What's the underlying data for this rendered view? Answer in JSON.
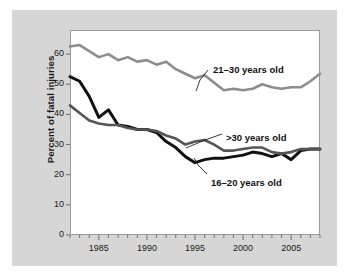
{
  "figure": {
    "background_color": "#d6d6d6",
    "plot_background_color": "#ffffff",
    "frame_color": "#9a9a9a"
  },
  "chart_data": {
    "type": "line",
    "title": "",
    "xlabel": "",
    "ylabel": "Percent of fatal injuries",
    "xlim": [
      1982,
      2008
    ],
    "ylim": [
      0,
      68
    ],
    "ytick_labels": [
      "0",
      "10",
      "20",
      "30",
      "40",
      "50",
      "60"
    ],
    "yticks": [
      0,
      10,
      20,
      30,
      40,
      50,
      60
    ],
    "xtick_labels": [
      "1985",
      "1990",
      "1995",
      "2000",
      "2005"
    ],
    "xticks": [
      1985,
      1990,
      1995,
      2000,
      2005
    ],
    "xtick_minor_step": 1,
    "grid": false,
    "legend_position": "inline-annotations",
    "x": [
      1982,
      1983,
      1984,
      1985,
      1986,
      1987,
      1988,
      1989,
      1990,
      1991,
      1992,
      1993,
      1994,
      1995,
      1996,
      1997,
      1998,
      1999,
      2000,
      2001,
      2002,
      2003,
      2004,
      2005,
      2006,
      2007,
      2008
    ],
    "series": [
      {
        "name": "21-30 years old",
        "label": "21–30 years old",
        "color": "#8d8d8d",
        "width": 2.6,
        "values": [
          62.5,
          63.0,
          61.0,
          59.0,
          60.0,
          58.0,
          59.0,
          57.5,
          58.0,
          56.5,
          57.5,
          55.0,
          53.5,
          52.0,
          53.0,
          50.5,
          48.0,
          48.5,
          48.0,
          48.5,
          50.0,
          49.0,
          48.5,
          49.0,
          49.0,
          51.0,
          53.5
        ]
      },
      {
        "name": "16-20 years old",
        "label": "16–20 years old",
        "color": "#111111",
        "width": 3.0,
        "values": [
          52.5,
          51.0,
          46.0,
          39.0,
          41.5,
          36.5,
          36.0,
          35.0,
          35.0,
          34.0,
          31.0,
          29.0,
          26.0,
          24.0,
          25.0,
          25.5,
          25.5,
          26.0,
          26.5,
          27.5,
          27.0,
          26.0,
          27.0,
          25.0,
          28.0,
          28.5,
          28.5
        ]
      },
      {
        "name": ">30 years old",
        "label": ">30 years old",
        "color": "#555555",
        "width": 2.6,
        "values": [
          43.0,
          40.5,
          38.0,
          37.0,
          36.5,
          36.5,
          35.5,
          35.0,
          35.0,
          34.5,
          33.0,
          32.0,
          30.0,
          31.0,
          31.5,
          30.0,
          28.0,
          28.0,
          28.5,
          29.0,
          29.0,
          27.5,
          27.0,
          27.5,
          28.5,
          28.5,
          28.5
        ]
      }
    ],
    "annotations": [
      {
        "name": "label-21-30",
        "text": "21–30 years old",
        "x_px": 213,
        "y_px": 64
      },
      {
        "name": "label-over-30",
        "text": ">30 years old",
        "x_px": 226,
        "y_px": 132
      },
      {
        "name": "label-16-20",
        "text": "16–20 years old",
        "x_px": 211,
        "y_px": 177
      }
    ]
  }
}
